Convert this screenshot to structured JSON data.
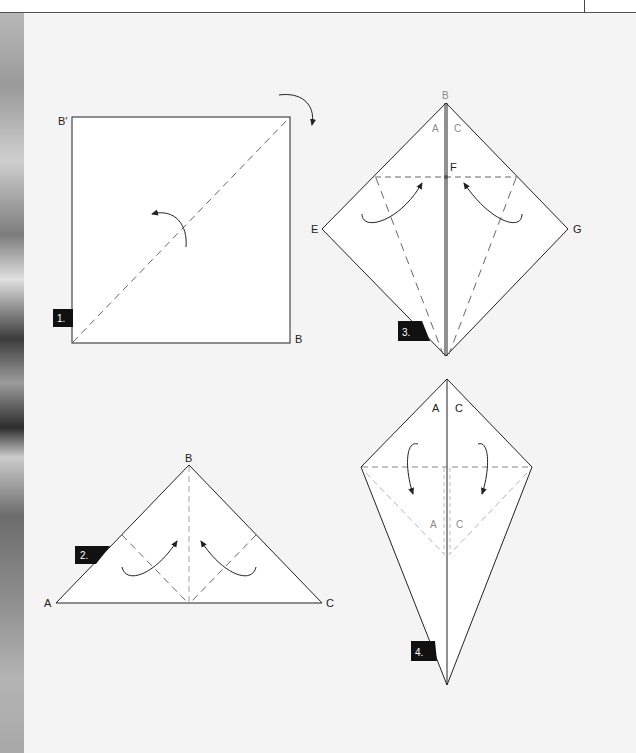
{
  "page": {
    "background": "#f4f4f4",
    "paper_color": "#ffffff",
    "line_color": "#222222",
    "fold_line_color": "#555555",
    "hidden_line_color": "#999999",
    "step_badge_color": "#111111"
  },
  "steps": [
    {
      "number": "1.",
      "shape": "square",
      "labels": {
        "top_left": "B′",
        "bottom_right": "B"
      }
    },
    {
      "number": "2.",
      "shape": "triangle",
      "labels": {
        "apex": "B",
        "left": "A",
        "right": "C"
      }
    },
    {
      "number": "3.",
      "shape": "diamond",
      "labels": {
        "top": "B",
        "top_left_inner": "A",
        "top_right_inner": "C",
        "center": "F",
        "left": "E",
        "right": "G"
      }
    },
    {
      "number": "4.",
      "shape": "kite",
      "labels": {
        "top_left_inner": "A",
        "top_right_inner": "C",
        "lower_left_inner": "A",
        "lower_right_inner": "C"
      }
    }
  ]
}
